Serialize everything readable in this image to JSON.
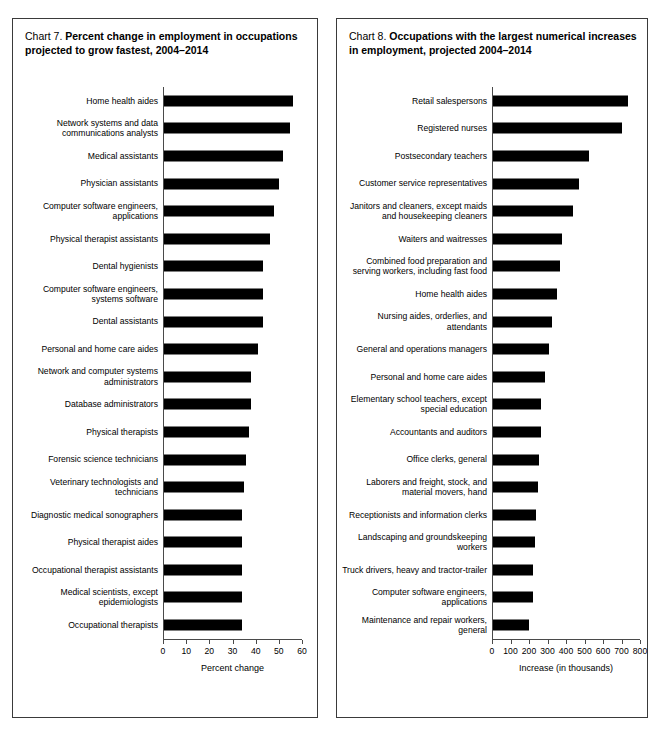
{
  "chart_data": [
    {
      "type": "bar",
      "orientation": "horizontal",
      "panel": "left",
      "title_number": "Chart 7.",
      "title": "Percent change in employment in occupations projected to grow fastest, 2004–2014",
      "xlabel": "Percent change",
      "ylabel": "",
      "xlim": [
        0,
        60
      ],
      "xticks": [
        0,
        10,
        20,
        30,
        40,
        50,
        60
      ],
      "grid": false,
      "legend": "none",
      "bar_color": "#000000",
      "categories": [
        "Home health aides",
        "Network systems and data\ncommunications analysts",
        "Medical assistants",
        "Physician assistants",
        "Computer software engineers,\napplications",
        "Physical therapist assistants",
        "Dental hygienists",
        "Computer software engineers,\nsystems software",
        "Dental assistants",
        "Personal and home care aides",
        "Network and computer systems\nadministrators",
        "Database administrators",
        "Physical therapists",
        "Forensic science technicians",
        "Veterinary technologists and\ntechnicians",
        "Diagnostic medical sonographers",
        "Physical therapist aides",
        "Occupational therapist assistants",
        "Medical scientists, except\nepidemiologists",
        "Occupational therapists"
      ],
      "values": [
        56,
        55,
        52,
        50,
        48,
        46,
        43,
        43,
        43,
        41,
        38,
        38,
        37,
        36,
        35,
        34,
        34,
        34,
        34,
        34
      ]
    },
    {
      "type": "bar",
      "orientation": "horizontal",
      "panel": "right",
      "title_number": "Chart 8.",
      "title": "Occupations with the largest numerical increases in employment, projected 2004–2014",
      "xlabel": "Increase (in thousands)",
      "ylabel": "",
      "xlim": [
        0,
        800
      ],
      "xticks": [
        0,
        100,
        200,
        300,
        400,
        500,
        600,
        700,
        800
      ],
      "grid": false,
      "legend": "none",
      "bar_color": "#000000",
      "categories": [
        "Retail salespersons",
        "Registered nurses",
        "Postsecondary teachers",
        "Customer service representatives",
        "Janitors and cleaners, except maids\nand housekeeping cleaners",
        "Waiters and waitresses",
        "Combined food preparation and\nserving workers, including fast food",
        "Home health aides",
        "Nursing aides, orderlies, and\nattendants",
        "General and operations managers",
        "Personal and home care aides",
        "Elementary school teachers, except\nspecial education",
        "Accountants and auditors",
        "Office clerks, general",
        "Laborers and freight, stock, and\nmaterial movers, hand",
        "Receptionists and information clerks",
        "Landscaping and groundskeeping\nworkers",
        "Truck drivers, heavy and tractor-trailer",
        "Computer software engineers,\napplications",
        "Maintenance and repair workers,\ngeneral"
      ],
      "values": [
        736,
        703,
        524,
        471,
        440,
        376,
        367,
        350,
        325,
        308,
        287,
        265,
        264,
        256,
        248,
        238,
        230,
        223,
        222,
        202
      ]
    }
  ]
}
